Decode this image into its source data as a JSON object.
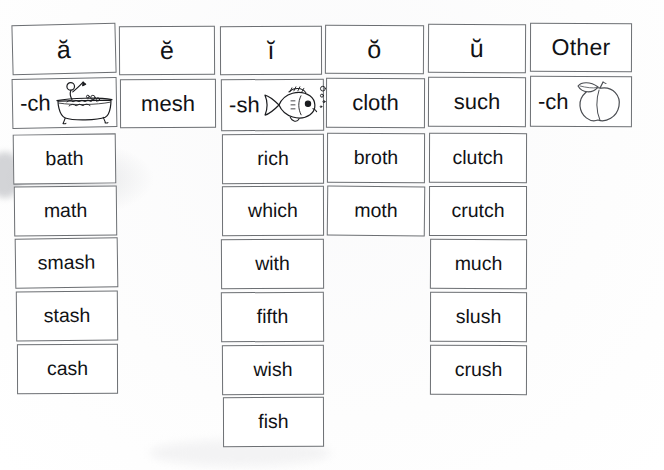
{
  "worksheet": {
    "title": "Short Vowel Digraph Word Sort",
    "background_color": "#ffffff",
    "card_border_color": "#6c6f73",
    "text_color": "#111215"
  },
  "columns": [
    {
      "id": "short-a",
      "header": "ă",
      "key_card": {
        "label": "-ch",
        "picture": "bathtub-icon",
        "picture_word": "bath"
      },
      "words": [
        "bath",
        "math",
        "smash",
        "stash",
        "cash"
      ]
    },
    {
      "id": "short-e",
      "header": "ĕ",
      "key_card": {
        "label": "mesh",
        "picture": null,
        "picture_word": null
      },
      "words": []
    },
    {
      "id": "short-i",
      "header": "ĭ",
      "key_card": {
        "label": "-sh",
        "picture": "fish-icon",
        "picture_word": "fish"
      },
      "words": [
        "rich",
        "which",
        "with",
        "fifth",
        "wish",
        "fish"
      ]
    },
    {
      "id": "short-o",
      "header": "ŏ",
      "key_card": {
        "label": "cloth",
        "picture": null,
        "picture_word": null
      },
      "words": [
        "broth",
        "moth"
      ]
    },
    {
      "id": "short-u",
      "header": "ŭ",
      "key_card": {
        "label": "such",
        "picture": null,
        "picture_word": null
      },
      "words": [
        "clutch",
        "crutch",
        "much",
        "slush",
        "crush"
      ]
    },
    {
      "id": "other",
      "header": "Other",
      "key_card": {
        "label": "-ch",
        "picture": "peach-icon",
        "picture_word": "peach"
      },
      "words": []
    }
  ]
}
